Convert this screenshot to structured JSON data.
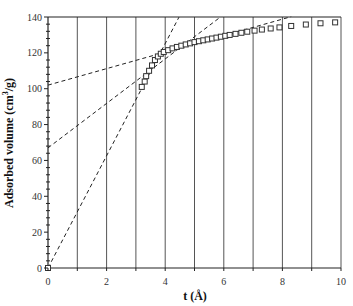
{
  "chart_data": {
    "type": "scatter",
    "title": "",
    "xlabel": "t (Å)",
    "ylabel": "Adsorbed volume (cm³/g)",
    "ylabel_parts": {
      "main": "Adsorbed volume (cm",
      "sup": "3",
      "tail": "/g)"
    },
    "xlim": [
      0,
      10
    ],
    "ylim": [
      0,
      140
    ],
    "xticks": [
      0,
      2,
      4,
      6,
      8,
      10
    ],
    "xtick_labels": [
      "0",
      "2",
      "4",
      "6",
      "8",
      "10"
    ],
    "yticks": [
      0,
      20,
      40,
      60,
      80,
      100,
      120,
      140
    ],
    "ytick_labels": [
      "0",
      "20",
      "40",
      "60",
      "80",
      "100",
      "120",
      "140"
    ],
    "vertical_grid": [
      1,
      2,
      3,
      4,
      5,
      6,
      7,
      8,
      9,
      10
    ],
    "grid": "vertical lines at every integer t",
    "legend": [],
    "marker": "open-square",
    "series": [
      {
        "name": "t-plot data",
        "x": [
          0,
          3.2,
          3.3,
          3.35,
          3.45,
          3.55,
          3.65,
          3.75,
          3.85,
          3.95,
          4.1,
          4.25,
          4.4,
          4.55,
          4.7,
          4.85,
          5.0,
          5.15,
          5.3,
          5.45,
          5.6,
          5.75,
          5.9,
          6.05,
          6.2,
          6.4,
          6.6,
          6.8,
          7.05,
          7.3,
          7.6,
          7.9,
          8.3,
          8.8,
          9.3,
          9.8
        ],
        "y": [
          0,
          101,
          104,
          107,
          110,
          113,
          116,
          118,
          119.5,
          120.5,
          121.5,
          122.5,
          123.3,
          124,
          124.7,
          125.3,
          126,
          126.5,
          127,
          127.5,
          128,
          128.5,
          129,
          129.5,
          130,
          130.6,
          131.2,
          131.8,
          132.4,
          133,
          133.6,
          134.2,
          135,
          135.8,
          136.5,
          137
        ]
      }
    ],
    "fit_lines": [
      {
        "name": "steep-fit",
        "style": "dashed",
        "intercept": 0,
        "slope": 31.3,
        "x_end": 4.47
      },
      {
        "name": "middle-fit",
        "style": "dashed",
        "intercept": 67,
        "slope": 12.4,
        "x_end": 5.87
      },
      {
        "name": "shallow-fit",
        "style": "dashed",
        "intercept": 102,
        "slope": 4.6,
        "x_end": 8.3
      }
    ]
  }
}
